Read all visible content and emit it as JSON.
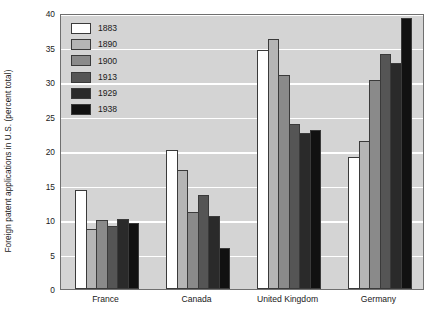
{
  "chart_data": {
    "type": "bar",
    "title": "",
    "xlabel": "",
    "ylabel": "Foreign patent applications in U.S. (percent total)",
    "ylim": [
      0,
      40
    ],
    "yticks": [
      0,
      5,
      10,
      15,
      20,
      25,
      30,
      35,
      40
    ],
    "grid": "horizontal white gridlines on gray panel",
    "legend_position": "inside top-left",
    "categories": [
      "France",
      "Canada",
      "United Kingdom",
      "Germany"
    ],
    "series": [
      {
        "name": "1883",
        "color": "#ffffff",
        "values": [
          14.4,
          20.2,
          34.7,
          19.2
        ]
      },
      {
        "name": "1890",
        "color": "#b5b5b5",
        "values": [
          8.7,
          17.3,
          36.3,
          21.5
        ]
      },
      {
        "name": "1900",
        "color": "#8a8a8a",
        "values": [
          10.0,
          11.2,
          31.0,
          30.3
        ]
      },
      {
        "name": "1913",
        "color": "#555555",
        "values": [
          9.1,
          13.6,
          23.9,
          34.0
        ]
      },
      {
        "name": "1929",
        "color": "#2a2a2a",
        "values": [
          10.2,
          10.6,
          22.6,
          32.8
        ]
      },
      {
        "name": "1938",
        "color": "#111111",
        "values": [
          9.6,
          6.0,
          23.0,
          39.3
        ]
      }
    ]
  },
  "style": {
    "panel_bg": "#d4d4d4",
    "gridline_color": "#ffffff",
    "axis_color": "#6f6f6f",
    "bar_outline": "#3a3a3a",
    "text_color": "#1a1a1a"
  }
}
